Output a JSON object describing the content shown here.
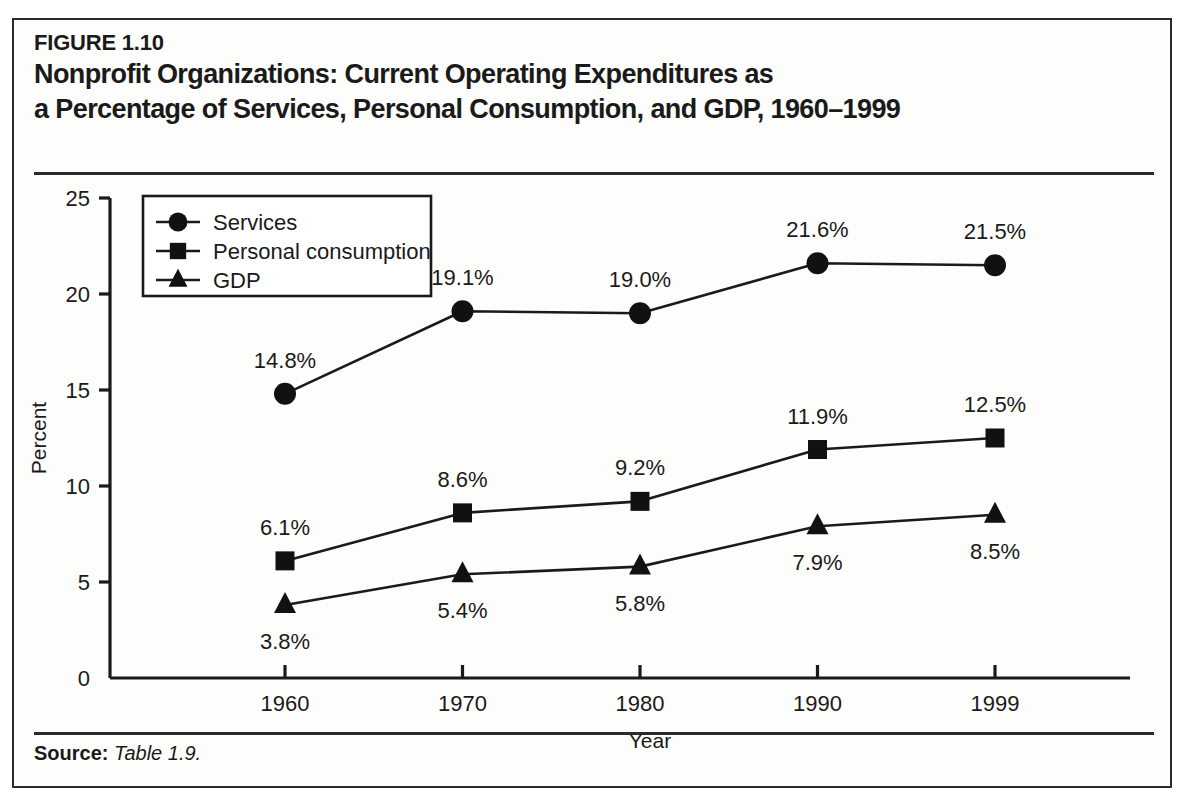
{
  "figure": {
    "number": "FIGURE 1.10",
    "title_line_1": "Nonprofit Organizations: Current Operating Expenditures as",
    "title_line_2": "a Percentage of Services, Personal Consumption, and GDP, 1960–1999",
    "source_label": "Source:",
    "source_value": "Table 1.9."
  },
  "chart_data": {
    "type": "line",
    "title": "Nonprofit Organizations: Current Operating Expenditures as a Percentage of Services, Personal Consumption, and GDP, 1960–1999",
    "xlabel": "Year",
    "ylabel": "Percent",
    "categories": [
      "1960",
      "1970",
      "1980",
      "1990",
      "1999"
    ],
    "x_tick_labels": [
      "1960",
      "1970",
      "1980",
      "1990",
      "1999"
    ],
    "y_tick_labels": [
      "0",
      "5",
      "10",
      "15",
      "20",
      "25"
    ],
    "y_ticks": [
      0,
      5,
      10,
      15,
      20,
      25
    ],
    "ylim": [
      0,
      25
    ],
    "grid": false,
    "legend_position": "upper-left-inside",
    "series": [
      {
        "name": "Services",
        "marker": "circle",
        "values": [
          14.8,
          19.1,
          19.0,
          21.6,
          21.5
        ],
        "data_labels": [
          "14.8%",
          "19.1%",
          "19.0%",
          "21.6%",
          "21.5%"
        ],
        "label_position": [
          "above",
          "above",
          "above",
          "above",
          "above"
        ]
      },
      {
        "name": "Personal consumption",
        "marker": "square",
        "values": [
          6.1,
          8.6,
          9.2,
          11.9,
          12.5
        ],
        "data_labels": [
          "6.1%",
          "8.6%",
          "9.2%",
          "11.9%",
          "12.5%"
        ],
        "label_position": [
          "above",
          "above",
          "above",
          "above",
          "above"
        ]
      },
      {
        "name": "GDP",
        "marker": "triangle",
        "values": [
          3.8,
          5.4,
          5.8,
          7.9,
          8.5
        ],
        "data_labels": [
          "3.8%",
          "5.4%",
          "5.8%",
          "7.9%",
          "8.5%"
        ],
        "label_position": [
          "below",
          "below",
          "below",
          "below",
          "below"
        ]
      }
    ],
    "colors": {
      "line": "#1a1a1a",
      "marker": "#111111",
      "axis": "#1a1a1a",
      "background": "#fdfdfb"
    }
  }
}
